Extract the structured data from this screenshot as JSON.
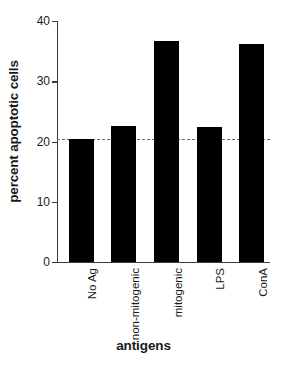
{
  "chart_data": {
    "type": "bar",
    "title": "",
    "xlabel": "antigens",
    "ylabel": "percent apoptotic cells",
    "categories": [
      "No Ag",
      "non-mitogenic",
      "mitogenic",
      "LPS",
      "ConA"
    ],
    "values": [
      20.4,
      22.6,
      36.7,
      22.4,
      36.2
    ],
    "ylim": [
      0,
      40
    ],
    "yticks": [
      0,
      10,
      20,
      30,
      40
    ],
    "ytick_labels": [
      "0",
      "10",
      "20",
      "30",
      "40"
    ],
    "grid": false,
    "legend": null,
    "annotations": [
      {
        "type": "reference-line",
        "style": "dashed",
        "orientation": "horizontal",
        "value": 20.4,
        "color": "#6b6b6b"
      }
    ],
    "bar_color": "#000000",
    "axis_color": "#3a3a3a"
  }
}
